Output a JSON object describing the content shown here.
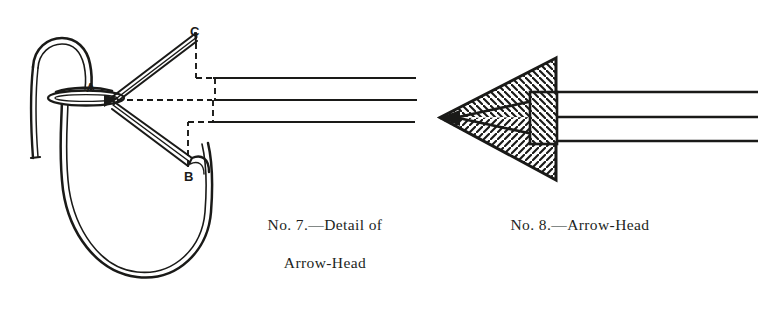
{
  "plate": {
    "background_color": "#ffffff",
    "ink_color": "#1a1a18",
    "title": "Arrow-Head Figures"
  },
  "figures": [
    {
      "id": "fig-7",
      "name": "detail-of-arrow-head",
      "caption_line_1": "No. 7.—Detail of",
      "caption_line_2": "Arrow-Head",
      "labels": [
        {
          "key": "a",
          "text": "A"
        },
        {
          "key": "b",
          "text": "B"
        },
        {
          "key": "c",
          "text": "C"
        }
      ]
    },
    {
      "id": "fig-8",
      "name": "arrow-head",
      "caption_line_1": "No. 8.—Arrow-Head",
      "caption_line_2": ""
    }
  ],
  "captions": {
    "fig7_line1": "No. 7.—Detail of",
    "fig7_line2": "Arrow-Head",
    "fig8_line1": "No. 8.—Arrow-Head"
  },
  "labels": {
    "a": "A",
    "b": "B",
    "c": "C"
  }
}
